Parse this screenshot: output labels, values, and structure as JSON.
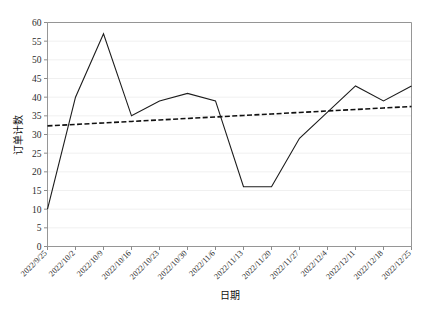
{
  "chart_data": {
    "type": "line",
    "title": "",
    "xlabel": "日期",
    "ylabel": "订单计数",
    "ylim": [
      0,
      60
    ],
    "ytick_step": 5,
    "grid": true,
    "legend": "none",
    "yticks": [
      "0",
      "5",
      "10",
      "15",
      "20",
      "25",
      "30",
      "35",
      "40",
      "45",
      "50",
      "55",
      "60"
    ],
    "categories": [
      "2022/9/25",
      "2022/10/2",
      "2022/10/9",
      "2022/10/16",
      "2022/10/23",
      "2022/10/30",
      "2022/11/6",
      "2022/11/13",
      "2022/11/20",
      "2022/11/27",
      "2022/12/4",
      "2022/12/11",
      "2022/12/18",
      "2022/12/25"
    ],
    "series": [
      {
        "name": "订单计数",
        "style": "solid",
        "color": "#1c1c1c",
        "values": [
          10,
          40,
          57,
          35,
          39,
          41,
          39,
          16,
          16,
          29,
          36,
          43,
          39,
          43
        ]
      },
      {
        "name": "趋势线",
        "style": "dashed",
        "color": "#111111",
        "values": [
          32.3,
          32.7,
          33.1,
          33.5,
          33.9,
          34.3,
          34.7,
          35.1,
          35.5,
          35.9,
          36.3,
          36.7,
          37.1,
          37.5
        ]
      }
    ]
  },
  "colors": {
    "axis": "#8a8a8a",
    "grid": "#e9e9e9",
    "text": "#1a1a1a",
    "background": "#ffffff"
  }
}
